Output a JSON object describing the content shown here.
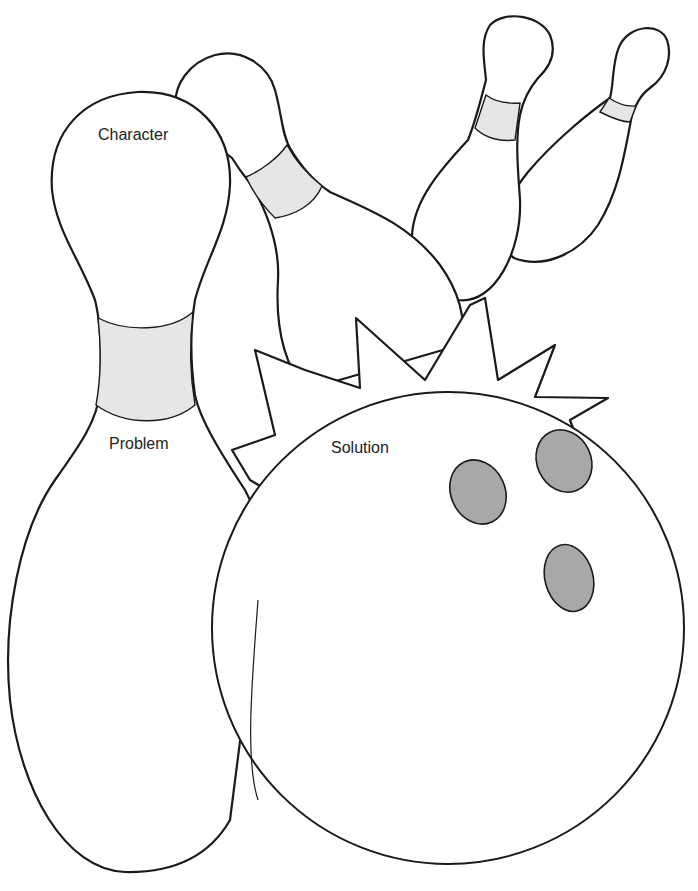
{
  "organizer": {
    "title": "Bowling Story Map",
    "labels": {
      "character": "Character",
      "problem": "Problem",
      "solution": "Solution"
    },
    "sections": [
      {
        "id": "character",
        "shape": "bowling-pin head (front pin)",
        "label": "Character"
      },
      {
        "id": "problem",
        "shape": "bowling-pin body (front pin)",
        "label": "Problem"
      },
      {
        "id": "solution",
        "shape": "bowling ball with starburst",
        "label": "Solution"
      }
    ],
    "decorations": {
      "background_pins": 3,
      "ball_finger_holes": 3,
      "starburst": "impact-burst-icon"
    },
    "colors": {
      "outline": "#1a1a1a",
      "pin_collar_fill": "#e6e6e6",
      "ball_hole_fill": "#a8a8a8",
      "background": "#ffffff",
      "text": "#222222"
    }
  }
}
